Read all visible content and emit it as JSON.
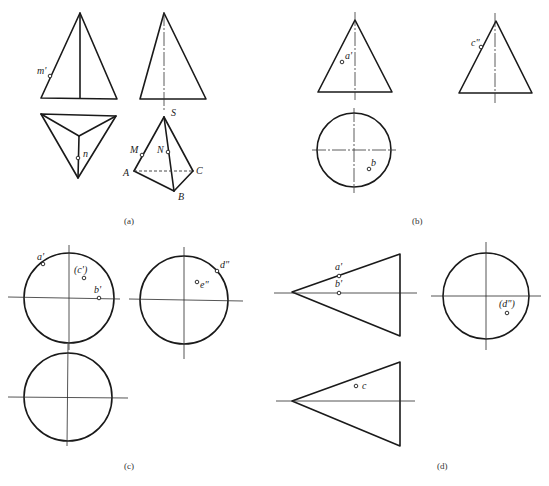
{
  "figure": {
    "panels": [
      {
        "id": "a",
        "caption": "(a)",
        "labels": {
          "m_prime": "m'",
          "n": "n",
          "S": "S",
          "M": "M",
          "N": "N",
          "A": "A",
          "B": "B",
          "C": "C"
        }
      },
      {
        "id": "b",
        "caption": "(b)",
        "labels": {
          "a_prime": "a'",
          "c_double_prime": "c\"",
          "b": "b"
        }
      },
      {
        "id": "c",
        "caption": "(c)",
        "labels": {
          "a_prime": "a'",
          "c_prime": "(c')",
          "b_prime": "b'",
          "d_double_prime": "d\"",
          "e_double_prime": "e\""
        }
      },
      {
        "id": "d",
        "caption": "(d)",
        "labels": {
          "a_prime": "a'",
          "b_prime": "b'",
          "d_double_prime": "(d\")",
          "c": "c"
        }
      }
    ]
  },
  "colors": {
    "line": "#1a1a1a",
    "background": "#ffffff"
  }
}
